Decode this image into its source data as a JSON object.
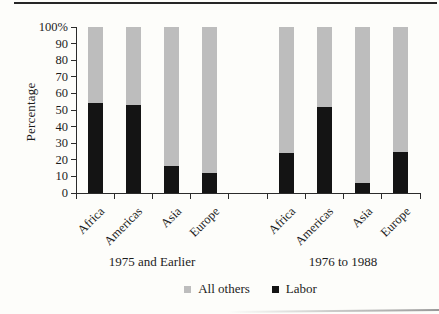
{
  "figure": {
    "background": "#fdfdfa"
  },
  "chart_data": {
    "type": "bar",
    "subtype": "stacked-percent",
    "title": "",
    "xlabel": "",
    "ylabel": "Percentage",
    "ylim": [
      0,
      100
    ],
    "ytick_interval": 10,
    "yticklabels": [
      "0",
      "10",
      "20",
      "30",
      "40",
      "50",
      "60",
      "70",
      "80",
      "90",
      "100%"
    ],
    "grid": "off",
    "legend_position": "bottom-center",
    "legend": [
      {
        "label": "All others",
        "color": "#bdbdbd"
      },
      {
        "label": "Labor",
        "color": "#141414"
      }
    ],
    "groups": [
      {
        "label": "1975 and Earlier",
        "categories": [
          "Africa",
          "Americas",
          "Asia",
          "Europe"
        ],
        "series": [
          {
            "name": "Labor",
            "values": [
              54,
              53,
              16,
              12
            ]
          },
          {
            "name": "All others",
            "values": [
              46,
              47,
              84,
              88
            ]
          }
        ]
      },
      {
        "label": "1976 to 1988",
        "categories": [
          "Africa",
          "Americas",
          "Asia",
          "Europe"
        ],
        "series": [
          {
            "name": "Labor",
            "values": [
              24,
              52,
              6,
              25
            ]
          },
          {
            "name": "All others",
            "values": [
              76,
              48,
              94,
              75
            ]
          }
        ]
      }
    ],
    "colors": {
      "labor": "#141414",
      "all_others": "#bdbdbd",
      "axis": "#2b2b2b",
      "text": "#1c1c1c"
    }
  }
}
